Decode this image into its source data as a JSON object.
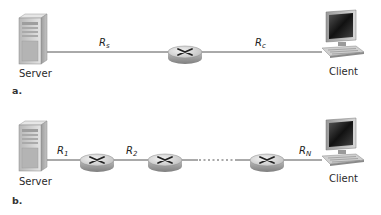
{
  "diagram_a": {
    "part_label": "a.",
    "server_label": "Server",
    "client_label": "Client",
    "links": [
      {
        "rate_symbol": "R",
        "rate_sub": "s"
      },
      {
        "rate_symbol": "R",
        "rate_sub": "c"
      }
    ],
    "router_count": 1
  },
  "diagram_b": {
    "part_label": "b.",
    "server_label": "Server",
    "client_label": "Client",
    "links": [
      {
        "rate_symbol": "R",
        "rate_sub": "1"
      },
      {
        "rate_symbol": "R",
        "rate_sub": "2"
      },
      {
        "rate_symbol": "R",
        "rate_sub": "N"
      }
    ],
    "router_count": 3,
    "ellipsis": "......"
  },
  "colors": {
    "line": "#555555",
    "router_top": "#d9d9d9",
    "router_side": "#9a9a9a",
    "server_body": "#cfcfcf",
    "screen": "#2b2b2b"
  }
}
